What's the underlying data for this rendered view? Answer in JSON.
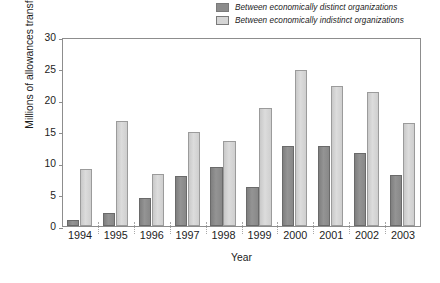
{
  "chart_data": {
    "type": "bar",
    "title": "",
    "subtitle": "",
    "xlabel": "Year",
    "ylabel": "Millions of allowances transferred",
    "categories": [
      "1994",
      "1995",
      "1996",
      "1997",
      "1998",
      "1999",
      "2000",
      "2001",
      "2002",
      "2003"
    ],
    "series": [
      {
        "name": "Between economically distinct organizations",
        "color": "#8c8c8c",
        "values": [
          1.0,
          2.0,
          4.4,
          7.9,
          9.4,
          6.2,
          12.7,
          12.7,
          11.6,
          8.1
        ]
      },
      {
        "name": "Between economically indistinct organizations",
        "color": "#d5d5d5",
        "values": [
          9.1,
          16.6,
          8.2,
          15.0,
          13.5,
          18.7,
          24.8,
          22.3,
          21.2,
          16.4
        ]
      }
    ],
    "ylim": [
      0,
      30
    ],
    "yticks": [
      0,
      5,
      10,
      15,
      20,
      25,
      30
    ],
    "ytick_labels": [
      "0",
      "5",
      "10",
      "15",
      "20",
      "25",
      "30"
    ],
    "grid": false,
    "legend_position": "top-right"
  }
}
